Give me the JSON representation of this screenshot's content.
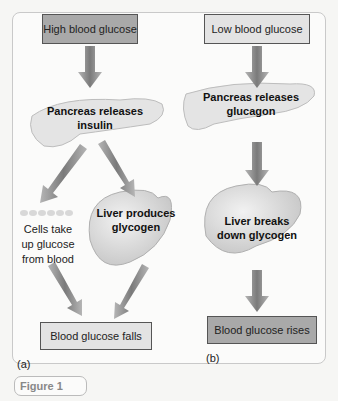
{
  "figure": {
    "caption": "Figure 1",
    "panel_a": {
      "label": "(a)",
      "start": "High blood glucose",
      "pancreas": "Pancreas releases insulin",
      "pancreas_line1": "Pancreas releases",
      "pancreas_line2": "insulin",
      "cells_line1": "Cells take",
      "cells_line2": "up glucose",
      "cells_line3": "from blood",
      "liver_line1": "Liver produces",
      "liver_line2": "glycogen",
      "end": "Blood glucose falls"
    },
    "panel_b": {
      "label": "(b)",
      "start": "Low blood glucose",
      "pancreas_line1": "Pancreas releases",
      "pancreas_line2": "glucagon",
      "liver_line1": "Liver breaks",
      "liver_line2": "down glycogen",
      "end": "Blood glucose rises"
    },
    "colors": {
      "dark_box": "#a9a9a9",
      "light_box": "#e3e3e3",
      "arrow": "#8a8a8a"
    }
  }
}
